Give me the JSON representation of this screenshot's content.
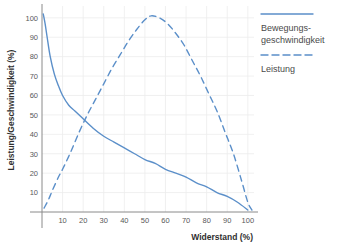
{
  "chart_data": {
    "type": "line",
    "title": "",
    "xlabel": "Widerstand (%)",
    "ylabel": "Leistung/Geschwindigkeit (%)",
    "xlim": [
      0,
      103
    ],
    "ylim": [
      0,
      103
    ],
    "xticks": [
      "10",
      "20",
      "30",
      "40",
      "50",
      "60",
      "70",
      "80",
      "90",
      "100"
    ],
    "xtick_values": [
      10,
      20,
      30,
      40,
      50,
      60,
      70,
      80,
      90,
      100
    ],
    "yticks": [
      "10",
      "20",
      "30",
      "40",
      "50",
      "60",
      "70",
      "80",
      "90",
      "100"
    ],
    "ytick_values": [
      10,
      20,
      30,
      40,
      50,
      60,
      70,
      80,
      90,
      100
    ],
    "grid": true,
    "legend_position": "right",
    "line_color": "#5b8fc9",
    "grid_color": "#ececec",
    "axis_color": "#8a8a8a",
    "series": [
      {
        "name": "Bewegungsgeschwindigkeit",
        "style": "solid",
        "color": "#5b8fc9",
        "x": [
          0.6,
          1.5,
          2.5,
          4,
          6,
          8,
          10,
          13,
          16,
          20,
          25,
          30,
          35,
          40,
          45,
          50,
          55,
          60,
          65,
          70,
          75,
          80,
          85,
          90,
          95,
          100
        ],
        "y": [
          102,
          97,
          90,
          80,
          71,
          65,
          60,
          55,
          52,
          48,
          43,
          39,
          36,
          33,
          30,
          27,
          25,
          22,
          20,
          18,
          15,
          13,
          10,
          8,
          5,
          1
        ]
      },
      {
        "name": "Leistung",
        "style": "dashed",
        "color": "#5b8fc9",
        "x": [
          1,
          3,
          5,
          8,
          10,
          14,
          18,
          22,
          26,
          30,
          34,
          38,
          42,
          46,
          50,
          53,
          57,
          61,
          65,
          69,
          73,
          77,
          81,
          85,
          89,
          93,
          97,
          100,
          102
        ],
        "y": [
          2,
          6,
          11,
          18,
          22,
          31,
          41,
          50,
          58,
          66,
          74,
          81,
          88,
          94,
          99,
          101,
          100,
          97,
          92,
          86,
          78,
          70,
          61,
          52,
          41,
          30,
          16,
          5,
          1
        ]
      }
    ]
  },
  "legend": {
    "items": [
      {
        "label_line1": "Bewegungs-",
        "label_line2": "geschwindigkeit",
        "style": "solid"
      },
      {
        "label_line1": "Leistung",
        "label_line2": "",
        "style": "dashed"
      }
    ]
  }
}
